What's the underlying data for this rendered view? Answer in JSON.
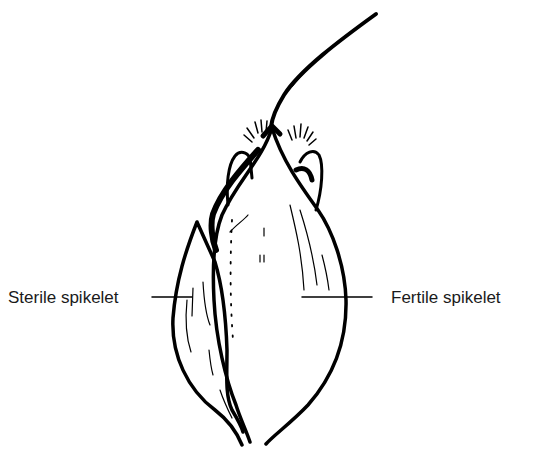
{
  "diagram": {
    "labels": [
      {
        "id": "sterile",
        "text": "Sterile spikelet"
      },
      {
        "id": "fertile",
        "text": "Fertile spikelet"
      }
    ],
    "colors": {
      "ink": "#000000",
      "text": "#1a1a1a",
      "background": "#ffffff"
    }
  }
}
